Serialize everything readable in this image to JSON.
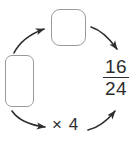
{
  "colors": {
    "background": "#ffffff",
    "box-border": "#9a9a9a",
    "ink": "#2e2e2e"
  },
  "fraction": {
    "numerator": "16",
    "denominator": "24"
  },
  "multiplier": "× 4",
  "boxes": {
    "left_blank": "",
    "top_blank": ""
  },
  "icons": {
    "arrow_left_to_top": "curved-arrow-up-right",
    "arrow_top_to_fraction": "curved-arrow-down-right",
    "arrow_left_to_multiplier": "curved-arrow-down-right",
    "arrow_multiplier_to_fraction": "curved-arrow-up-right"
  }
}
